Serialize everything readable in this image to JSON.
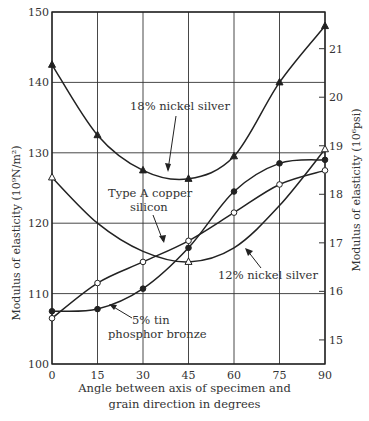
{
  "chart_data": {
    "type": "line",
    "title": "",
    "xlabel_line1": "Angle between axis of specimen and",
    "xlabel_line2": "grain direction in degrees",
    "ylabel_left": "Modulus of elasticity (10⁹N/m²)",
    "ylabel_right": "Modulus of elasticity (10⁶psi)",
    "x": [
      0,
      15,
      30,
      45,
      60,
      75,
      90
    ],
    "xlim": [
      0,
      90
    ],
    "ylim": [
      100,
      150
    ],
    "ylim_right_psi": [
      14.5,
      21.75
    ],
    "grid": true,
    "x_ticks": [
      "0",
      "15",
      "30",
      "45",
      "60",
      "75",
      "90"
    ],
    "y_ticks_left": [
      "100",
      "110",
      "120",
      "130",
      "140",
      "150"
    ],
    "y_ticks_right": [
      "15",
      "16",
      "17",
      "18",
      "19",
      "20",
      "21"
    ],
    "series": [
      {
        "name": "18% nickel silver",
        "marker": "filled-triangle",
        "x": [
          0,
          15,
          30,
          45,
          60,
          75,
          90
        ],
        "values": [
          142.5,
          132.5,
          127.5,
          126.3,
          129.5,
          140,
          148
        ]
      },
      {
        "name": "12% nickel silver",
        "marker": "open-triangle",
        "x": [
          0,
          45,
          90
        ],
        "values": [
          126.5,
          114.5,
          130.5
        ]
      },
      {
        "name": "Type A copper silicon",
        "marker": "open-circle",
        "x": [
          0,
          15,
          30,
          45,
          60,
          75,
          90
        ],
        "values": [
          106.5,
          111.5,
          114.5,
          117.5,
          121.5,
          125.5,
          127.5
        ]
      },
      {
        "name": "5% tin phosphor bronze",
        "marker": "filled-circle",
        "x": [
          0,
          15,
          30,
          45,
          60,
          75,
          90
        ],
        "values": [
          107.5,
          107.8,
          110.7,
          116.5,
          124.5,
          128.5,
          129
        ]
      }
    ],
    "annotations": [
      {
        "text": "18% nickel silver"
      },
      {
        "text_line1": "Type A copper",
        "text_line2": "silicon"
      },
      {
        "text": "12% nickel silver"
      },
      {
        "text_line1": "5% tin",
        "text_line2": "phosphor bronze"
      }
    ]
  }
}
